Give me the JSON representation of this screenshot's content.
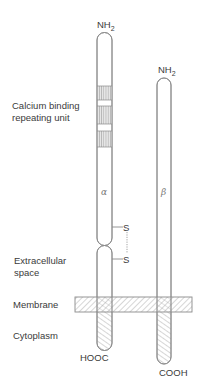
{
  "diagram": {
    "type": "protein-subunit-structure",
    "chains": [
      {
        "id": "alpha",
        "greek": "α",
        "n_terminus": "NH₂",
        "c_terminus": "HOOC"
      },
      {
        "id": "beta",
        "greek": "β",
        "n_terminus": "NH₂",
        "c_terminus": "COOH"
      }
    ],
    "labels": {
      "calcium_line1": "Calcium binding",
      "calcium_line2": "repeating unit",
      "extracellular_line1": "Extracellular",
      "extracellular_line2": "space",
      "membrane": "Membrane",
      "cytoplasm": "Cytoplasm"
    },
    "disulfide": {
      "s_top": "S",
      "s_bottom": "S"
    },
    "alpha_nh2": "NH",
    "alpha_nh2_sub": "2",
    "beta_nh2": "NH",
    "beta_nh2_sub": "2",
    "alpha_greek": "α",
    "beta_greek": "β",
    "alpha_cterm": "HOOC",
    "beta_cterm": "COOH",
    "calcium_binding_bands": 3
  }
}
